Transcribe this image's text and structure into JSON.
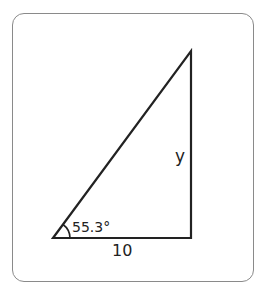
{
  "diagram": {
    "type": "right-triangle",
    "angle_label": "55.3°",
    "base_label": "10",
    "height_label": "y",
    "colors": {
      "stroke": "#222222",
      "border": "#8a8a8a"
    }
  }
}
